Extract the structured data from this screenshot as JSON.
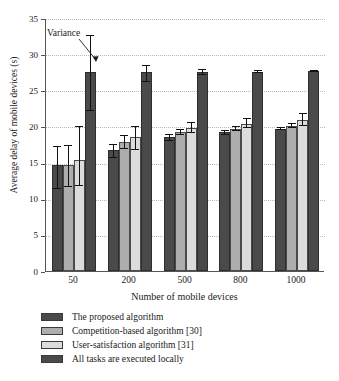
{
  "chart_data": {
    "type": "bar",
    "title": "",
    "xlabel": "Number of mobile devices",
    "ylabel": "Average delay of mobile devices (s)",
    "categories": [
      "50",
      "200",
      "500",
      "800",
      "1000"
    ],
    "ylim": [
      0,
      35
    ],
    "yticks": [
      0,
      5,
      10,
      15,
      20,
      25,
      30,
      35
    ],
    "grid": true,
    "legend_position": "below",
    "annotations": [
      {
        "text": "Variance",
        "points_to": "error-bar of 'All tasks are executed locally' at 50 devices"
      }
    ],
    "series": [
      {
        "name": "The proposed algorithm",
        "color": "#4a4a4a",
        "values": [
          14.7,
          16.7,
          18.5,
          19.2,
          19.7
        ],
        "err_low": [
          3.4,
          1.1,
          0.5,
          0.35,
          0.25
        ],
        "err_high": [
          2.6,
          0.9,
          0.45,
          0.3,
          0.25
        ]
      },
      {
        "name": "Competition-based algorithm [30]",
        "color": "#adadad",
        "values": [
          14.6,
          17.9,
          19.2,
          19.7,
          20.1
        ],
        "err_low": [
          3.0,
          1.0,
          0.4,
          0.3,
          0.3
        ],
        "err_high": [
          2.9,
          0.9,
          0.4,
          0.3,
          0.35
        ]
      },
      {
        "name": "User-satisfaction algorithm [31]",
        "color": "#dcdcdc",
        "values": [
          15.4,
          18.5,
          19.8,
          20.4,
          20.9
        ],
        "err_low": [
          3.7,
          1.7,
          0.7,
          0.6,
          0.8
        ],
        "err_high": [
          4.6,
          1.5,
          0.8,
          0.8,
          0.9
        ]
      },
      {
        "name": "All tasks are executed locally",
        "color": "#4a4a4a",
        "values": [
          27.5,
          27.5,
          27.5,
          27.6,
          27.7
        ],
        "err_low": [
          5.4,
          1.4,
          0.35,
          0.15,
          0.12
        ],
        "err_high": [
          5.2,
          1.0,
          0.4,
          0.2,
          0.15
        ]
      }
    ]
  },
  "axis": {
    "y_tick_labels": [
      "0",
      "5",
      "10",
      "15",
      "20",
      "25",
      "30",
      "35"
    ],
    "x_tick_labels": [
      "50",
      "200",
      "500",
      "800",
      "1000"
    ]
  },
  "legend": {
    "items": [
      {
        "label": "The proposed algorithm",
        "swatch": "#4a4a4a"
      },
      {
        "label": "Competition-based algorithm [30]",
        "swatch": "#adadad"
      },
      {
        "label": "User-satisfaction algorithm [31]",
        "swatch": "#dcdcdc"
      },
      {
        "label": "All tasks are executed locally",
        "swatch": "#4a4a4a"
      }
    ]
  },
  "annotation": {
    "variance_label": "Variance"
  }
}
